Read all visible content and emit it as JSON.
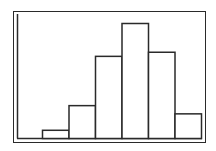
{
  "chart_data": {
    "type": "bar",
    "title": "",
    "xlabel": "",
    "ylabel": "",
    "categories": [
      "1",
      "2",
      "3",
      "4",
      "5",
      "6"
    ],
    "values": [
      1,
      4,
      10,
      14,
      10.5,
      3
    ],
    "ylim": [
      0,
      14
    ],
    "grid": false,
    "legend": null
  },
  "colors": {
    "stroke": "#2a2a2a",
    "fill": "#ffffff"
  }
}
